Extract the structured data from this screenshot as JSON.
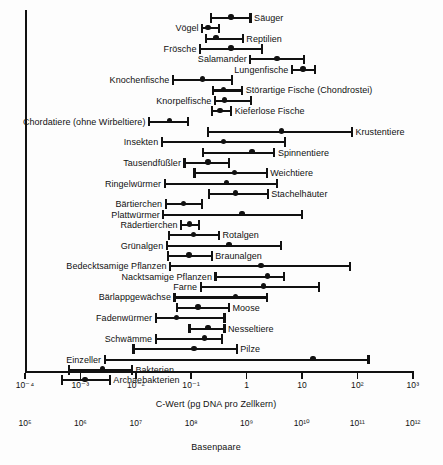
{
  "figure": {
    "x_axis": {
      "caption": "C-Wert (pg DNA pro Zellkern)",
      "ticks": [
        "10⁻⁴",
        "10⁻³",
        "10⁻²",
        "10⁻¹",
        "1",
        "10",
        "10²",
        "10³"
      ],
      "tick_exponents": [
        -4,
        -3,
        -2,
        -1,
        0,
        1,
        2,
        3
      ]
    },
    "secondary_axis": {
      "caption": "Basenpaare",
      "ticks": [
        "10⁵",
        "10⁶",
        "10⁷",
        "10⁸",
        "10⁹",
        "10¹⁰",
        "10¹¹",
        "10¹²"
      ],
      "tick_exponents": [
        5,
        6,
        7,
        8,
        9,
        10,
        11,
        12
      ]
    },
    "colors": {
      "ink": "#111111",
      "background": "#ffffff"
    }
  },
  "chart_data": {
    "type": "range",
    "title": "",
    "xlabel": "C-Wert (pg DNA pro Zellkern)",
    "xlabel_secondary": "Basenpaare",
    "ylabel": "",
    "xscale": "log10",
    "xlim": [
      -4,
      3
    ],
    "grid": false,
    "legend": "none",
    "note": "Horizontale Balken = Bereich des C-Werts je Gruppe; Punkt = typischer Wert",
    "items": [
      {
        "label": "Säuger",
        "min": -0.66,
        "max": 0.09,
        "typical": -0.28,
        "label_side": "right"
      },
      {
        "label": "Vögel",
        "min": -0.82,
        "max": -0.48,
        "typical": -0.7,
        "label_side": "left"
      },
      {
        "label": "Reptilien",
        "min": -0.75,
        "max": -0.05,
        "typical": -0.55,
        "label_side": "right"
      },
      {
        "label": "Frösche",
        "min": -0.86,
        "max": 0.29,
        "typical": -0.28,
        "label_side": "left"
      },
      {
        "label": "Salamander",
        "min": 0.05,
        "max": 1.05,
        "typical": 0.55,
        "label_side": "left"
      },
      {
        "label": "Lungenfische",
        "min": 0.8,
        "max": 1.25,
        "typical": 1.02,
        "label_side": "left"
      },
      {
        "label": "Knochenfische",
        "min": -1.35,
        "max": -0.25,
        "typical": -0.8,
        "label_side": "left"
      },
      {
        "label": "Störartige Fische (Chondrostei)",
        "min": -0.62,
        "max": -0.06,
        "typical": -0.42,
        "label_side": "right"
      },
      {
        "label": "Knorpelfische",
        "min": -0.59,
        "max": 0.1,
        "typical": -0.4,
        "label_side": "left"
      },
      {
        "label": "Kieferlose Fische",
        "min": -0.64,
        "max": -0.26,
        "typical": -0.48,
        "label_side": "right"
      },
      {
        "label": "Chordatiere (ohne Wirbeltiere)",
        "min": -1.78,
        "max": -1.04,
        "typical": -1.39,
        "label_side": "left"
      },
      {
        "label": "Krustentiere",
        "min": -0.72,
        "max": 1.92,
        "typical": 0.63,
        "label_side": "right"
      },
      {
        "label": "Insekten",
        "min": -1.55,
        "max": 0.72,
        "typical": -0.42,
        "label_side": "left"
      },
      {
        "label": "Spinnentiere",
        "min": -0.8,
        "max": 0.52,
        "typical": 0.1,
        "label_side": "right"
      },
      {
        "label": "Tausendfüßler",
        "min": -1.14,
        "max": -0.3,
        "typical": -0.7,
        "label_side": "left"
      },
      {
        "label": "Weichtiere",
        "min": -0.96,
        "max": 0.38,
        "typical": -0.22,
        "label_side": "right"
      },
      {
        "label": "Ringelwürmer",
        "min": -1.5,
        "max": 0.56,
        "typical": -0.36,
        "label_side": "left"
      },
      {
        "label": "Stachelhäuter",
        "min": -0.7,
        "max": 0.4,
        "typical": -0.2,
        "label_side": "right"
      },
      {
        "label": "Bärtierchen",
        "min": -1.48,
        "max": -0.78,
        "typical": -1.14,
        "label_side": "left"
      },
      {
        "label": "Plattwürmer",
        "min": -1.52,
        "max": 1.02,
        "typical": -0.08,
        "label_side": "left"
      },
      {
        "label": "Rädertierchen",
        "min": -1.2,
        "max": -0.84,
        "typical": -1.03,
        "label_side": "left"
      },
      {
        "label": "Rotalgen",
        "min": -1.42,
        "max": -0.48,
        "typical": -0.96,
        "label_side": "right"
      },
      {
        "label": "Grünalgen",
        "min": -1.46,
        "max": 0.64,
        "typical": -0.32,
        "label_side": "left"
      },
      {
        "label": "Braunalgen",
        "min": -1.43,
        "max": -0.61,
        "typical": -1.04,
        "label_side": "right"
      },
      {
        "label": "Bedecktsamige Pflanzen",
        "min": -1.4,
        "max": 1.88,
        "typical": 0.26,
        "label_side": "left"
      },
      {
        "label": "Nacktsamige Pflanzen",
        "min": -0.58,
        "max": 0.7,
        "typical": 0.38,
        "label_side": "left"
      },
      {
        "label": "Farne",
        "min": -0.85,
        "max": 1.32,
        "typical": 0.3,
        "label_side": "left"
      },
      {
        "label": "Bärlappgewächse",
        "min": -1.32,
        "max": 0.38,
        "typical": -0.2,
        "label_side": "left"
      },
      {
        "label": "Moose",
        "min": -1.28,
        "max": -0.3,
        "typical": -0.88,
        "label_side": "right"
      },
      {
        "label": "Fadenwürmer",
        "min": -1.66,
        "max": -0.38,
        "typical": -1.26,
        "label_side": "left"
      },
      {
        "label": "Nesseltiere",
        "min": -1.05,
        "max": -0.38,
        "typical": -0.7,
        "label_side": "right"
      },
      {
        "label": "Schwämme",
        "min": -1.66,
        "max": -0.42,
        "typical": -0.76,
        "label_side": "left"
      },
      {
        "label": "Pilze",
        "min": -2.06,
        "max": -0.16,
        "typical": -0.95,
        "label_side": "right"
      },
      {
        "label": "Einzeller",
        "min": -2.58,
        "max": 2.22,
        "typical": 1.2,
        "label_side": "left"
      },
      {
        "label": "Bakterien",
        "min": -3.22,
        "max": -2.05,
        "typical": -2.6,
        "label_side": "right"
      },
      {
        "label": "Archaebakterien",
        "min": -3.35,
        "max": -2.45,
        "typical": -2.92,
        "label_side": "right"
      }
    ]
  }
}
